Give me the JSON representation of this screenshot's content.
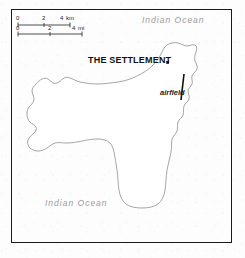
{
  "map": {
    "frame": {
      "border_color": "#1a1a1a"
    },
    "background_color": "#fdfdfd",
    "island": {
      "name": "christmas-island",
      "outline_color": "#9b9b9b",
      "fill_color": "#ffffff"
    },
    "scale_bar": {
      "km": {
        "ticks": [
          "0",
          "2",
          "4"
        ],
        "unit": "km"
      },
      "mi": {
        "ticks": [
          "0",
          "2",
          "4"
        ],
        "unit": "mi"
      },
      "line_color": "#222222"
    },
    "labels": {
      "settlement": "THE SETTLEMENT",
      "airfield": "airfield",
      "ocean_northeast": "Indian  Ocean",
      "ocean_southwest": "Indian  Ocean"
    },
    "markers": {
      "settlement_dot": "city-dot-marker",
      "airfield_runway": "runway-line"
    }
  }
}
